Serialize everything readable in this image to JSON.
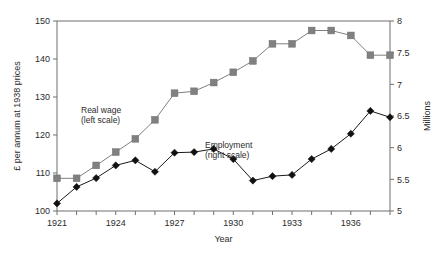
{
  "chart_data": {
    "type": "line",
    "title": "",
    "xlabel": "Year",
    "ylabel_left": "£ per annum at 1938 prices",
    "ylabel_right": "Millions",
    "grid": false,
    "legend_position": "inline-annotation",
    "x": [
      1921,
      1922,
      1923,
      1924,
      1925,
      1926,
      1927,
      1928,
      1929,
      1930,
      1931,
      1932,
      1933,
      1934,
      1935,
      1936,
      1937,
      1938
    ],
    "xlim": [
      1921,
      1938
    ],
    "xticks_all": [
      1921,
      1922,
      1923,
      1924,
      1925,
      1926,
      1927,
      1928,
      1929,
      1930,
      1931,
      1932,
      1933,
      1934,
      1935,
      1936,
      1937,
      1938
    ],
    "xtick_labels": [
      "1921",
      "",
      "",
      "1924",
      "",
      "",
      "1927",
      "",
      "",
      "1930",
      "",
      "",
      "1933",
      "",
      "",
      "1936",
      "",
      ""
    ],
    "xtick_labels_shown": [
      "1921",
      "1924",
      "1927",
      "1930",
      "1933",
      "1936"
    ],
    "ylim_left": [
      100,
      150
    ],
    "yticks_left": [
      100,
      110,
      120,
      130,
      140,
      150
    ],
    "ytick_labels_left": [
      "100",
      "110",
      "120",
      "130",
      "140",
      "150"
    ],
    "ylim_right": [
      5,
      8
    ],
    "yticks_right": [
      5,
      5.5,
      6,
      6.5,
      7,
      7.5,
      8
    ],
    "ytick_labels_right": [
      "5",
      "5.5",
      "6",
      "6.5",
      "7",
      "7.5",
      "8"
    ],
    "series": [
      {
        "name": "Real wage",
        "axis": "left",
        "annotation": "Real wage\n(left scale)",
        "annotation_line1": "Real wage",
        "annotation_line2": "(left scale)",
        "marker": "square",
        "color": "#808080",
        "values": [
          108.6,
          108.6,
          112.0,
          115.5,
          119.0,
          124.0,
          131.0,
          131.5,
          133.8,
          136.5,
          139.5,
          144.0,
          144.0,
          147.5,
          147.5,
          146.2,
          141.0,
          141.0
        ]
      },
      {
        "name": "Employment",
        "axis": "right",
        "annotation": "Employment\n(right scale)",
        "annotation_line1": "Employment",
        "annotation_line2": "(right scale)",
        "marker": "diamond",
        "color": "#111111",
        "values": [
          5.12,
          5.38,
          5.52,
          5.72,
          5.8,
          5.62,
          5.92,
          5.93,
          5.98,
          5.82,
          5.48,
          5.55,
          5.57,
          5.82,
          5.98,
          6.22,
          6.58,
          6.48
        ]
      }
    ]
  },
  "axes": {
    "x_title": "Year",
    "y_left_title": "£ per annum at 1938 prices",
    "y_right_title": "Millions"
  }
}
